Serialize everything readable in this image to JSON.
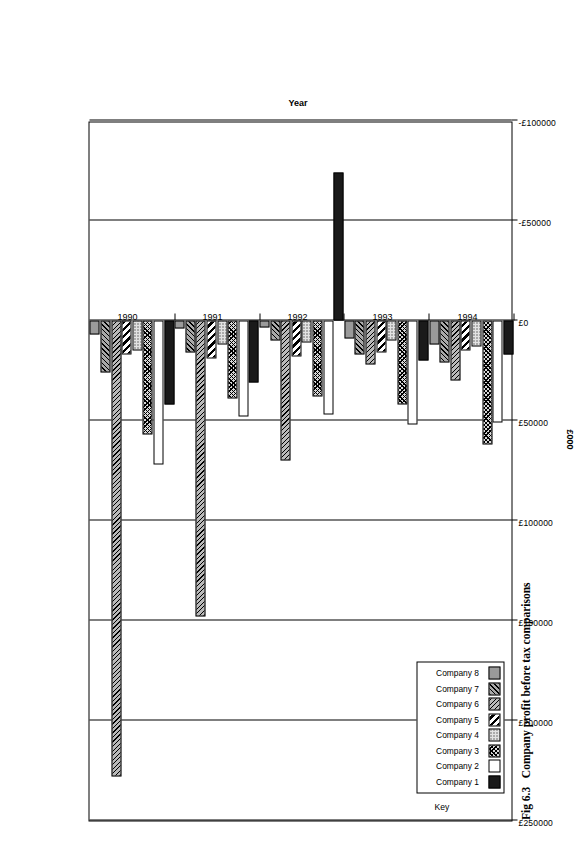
{
  "figure": {
    "caption_number": "Fig 6.3",
    "caption_text": "Company profit before tax comparisons"
  },
  "legend": {
    "title": "Key",
    "items": [
      {
        "label": "Company 1",
        "fill": "solid-black"
      },
      {
        "label": "Company 2",
        "fill": "white"
      },
      {
        "label": "Company 3",
        "fill": "cross-hatch-light"
      },
      {
        "label": "Company 4",
        "fill": "dotted"
      },
      {
        "label": "Company 5",
        "fill": "diagonal-bold"
      },
      {
        "label": "Company 6",
        "fill": "diagonal-fine-grey"
      },
      {
        "label": "Company 7",
        "fill": "reverse-diagonal-grey"
      },
      {
        "label": "Company 8",
        "fill": "solid-grey"
      }
    ]
  },
  "chart_data": {
    "type": "bar",
    "orientation": "horizontal",
    "title": "Company profit before tax comparisons",
    "xlabel": "Year",
    "ylabel": "£000",
    "grid": true,
    "legend_position": "inside-lower-left",
    "categories": [
      "1990",
      "1991",
      "1992",
      "1993",
      "1994"
    ],
    "tick_labels": [
      "£250000",
      "£200000",
      "£150000",
      "£100000",
      "£50000",
      "£0",
      "-£50000",
      "-£100000"
    ],
    "tick_values": [
      250000,
      200000,
      150000,
      100000,
      50000,
      0,
      -50000,
      -100000
    ],
    "ylim": [
      -100000,
      250000
    ],
    "series": [
      {
        "name": "Company 1",
        "values": [
          42000,
          31000,
          -74000,
          20000,
          17000
        ]
      },
      {
        "name": "Company 2",
        "values": [
          72000,
          48000,
          47000,
          52000,
          51000
        ]
      },
      {
        "name": "Company 3",
        "values": [
          57000,
          39000,
          38000,
          42000,
          62000
        ]
      },
      {
        "name": "Company 4",
        "values": [
          15000,
          12000,
          11000,
          10000,
          13000
        ]
      },
      {
        "name": "Company 5",
        "values": [
          17000,
          19000,
          18000,
          16000,
          15000
        ]
      },
      {
        "name": "Company 6",
        "values": [
          228000,
          148000,
          70000,
          22000,
          30000
        ]
      },
      {
        "name": "Company 7",
        "values": [
          26000,
          16000,
          10000,
          17000,
          21000
        ]
      },
      {
        "name": "Company 8",
        "values": [
          7000,
          4000,
          3500,
          9000,
          12000
        ]
      }
    ]
  }
}
